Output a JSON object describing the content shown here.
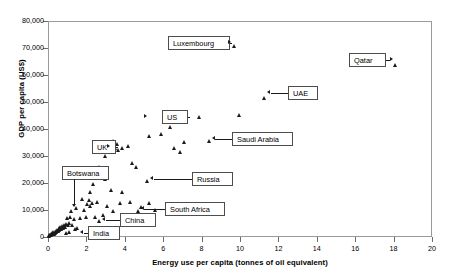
{
  "chart_data": {
    "type": "scatter",
    "title": "",
    "xlabel": "Energy use per capita (tonnes of oil equivalent)",
    "ylabel": "GDP per capita (US$)",
    "xlim": [
      0,
      20
    ],
    "ylim": [
      0,
      80000
    ],
    "grid": false,
    "legend": "none",
    "xticks": [
      "0",
      "2",
      "4",
      "6",
      "8",
      "10",
      "12",
      "14",
      "16",
      "18",
      "20"
    ],
    "xtick_values": [
      0,
      2,
      4,
      6,
      8,
      10,
      12,
      14,
      16,
      18,
      20
    ],
    "yticks": [
      "0",
      "10,000",
      "20,000",
      "30,000",
      "40,000",
      "50,000",
      "60,000",
      "70,000",
      "80,000"
    ],
    "ytick_values": [
      0,
      10000,
      20000,
      30000,
      40000,
      50000,
      60000,
      70000,
      80000
    ],
    "marker": "triangle",
    "marker_color": "#1a1a1a",
    "points": [
      {
        "x": 9.7,
        "y": 70500,
        "label": "Luxembourg"
      },
      {
        "x": 18.1,
        "y": 63500,
        "label": "Qatar"
      },
      {
        "x": 11.3,
        "y": 51500,
        "label": "UAE"
      },
      {
        "x": 10.0,
        "y": 45000,
        "label": ""
      },
      {
        "x": 7.9,
        "y": 44500,
        "label": ""
      },
      {
        "x": 6.4,
        "y": 40500,
        "label": ""
      },
      {
        "x": 8.4,
        "y": 35500,
        "label": "Saudi Arabia"
      },
      {
        "x": 5.9,
        "y": 38000,
        "label": ""
      },
      {
        "x": 7.1,
        "y": 35000,
        "label": ""
      },
      {
        "x": 5.3,
        "y": 37500,
        "label": "US"
      },
      {
        "x": 4.2,
        "y": 33500,
        "label": ""
      },
      {
        "x": 3.9,
        "y": 33000,
        "label": ""
      },
      {
        "x": 3.6,
        "y": 34500,
        "label": ""
      },
      {
        "x": 3.5,
        "y": 33000,
        "label": ""
      },
      {
        "x": 3.7,
        "y": 32000,
        "label": ""
      },
      {
        "x": 3.4,
        "y": 35500,
        "label": "UK"
      },
      {
        "x": 3.3,
        "y": 34000,
        "label": ""
      },
      {
        "x": 3.2,
        "y": 33000,
        "label": ""
      },
      {
        "x": 3.0,
        "y": 30000,
        "label": ""
      },
      {
        "x": 2.7,
        "y": 26000,
        "label": ""
      },
      {
        "x": 2.6,
        "y": 24000,
        "label": ""
      },
      {
        "x": 4.4,
        "y": 27500,
        "label": ""
      },
      {
        "x": 4.6,
        "y": 26000,
        "label": ""
      },
      {
        "x": 5.2,
        "y": 20500,
        "label": "Russia"
      },
      {
        "x": 3.0,
        "y": 21500,
        "label": ""
      },
      {
        "x": 2.4,
        "y": 19500,
        "label": ""
      },
      {
        "x": 2.2,
        "y": 16500,
        "label": ""
      },
      {
        "x": 3.3,
        "y": 17500,
        "label": ""
      },
      {
        "x": 3.9,
        "y": 16500,
        "label": ""
      },
      {
        "x": 4.3,
        "y": 13000,
        "label": ""
      },
      {
        "x": 3.8,
        "y": 12500,
        "label": ""
      },
      {
        "x": 3.1,
        "y": 11500,
        "label": ""
      },
      {
        "x": 2.6,
        "y": 13000,
        "label": ""
      },
      {
        "x": 2.3,
        "y": 12500,
        "label": ""
      },
      {
        "x": 2.2,
        "y": 11500,
        "label": ""
      },
      {
        "x": 1.8,
        "y": 14000,
        "label": ""
      },
      {
        "x": 1.5,
        "y": 10500,
        "label": ""
      },
      {
        "x": 5.3,
        "y": 12500,
        "label": ""
      },
      {
        "x": 4.9,
        "y": 11000,
        "label": ""
      },
      {
        "x": 5.6,
        "y": 10000,
        "label": ""
      },
      {
        "x": 4.7,
        "y": 9500,
        "label": "South Africa"
      },
      {
        "x": 3.4,
        "y": 9500,
        "label": ""
      },
      {
        "x": 2.9,
        "y": 8000,
        "label": ""
      },
      {
        "x": 2.5,
        "y": 7500,
        "label": ""
      },
      {
        "x": 2.0,
        "y": 7500,
        "label": ""
      },
      {
        "x": 1.7,
        "y": 7000,
        "label": ""
      },
      {
        "x": 1.4,
        "y": 6500,
        "label": ""
      },
      {
        "x": 1.2,
        "y": 7500,
        "label": ""
      },
      {
        "x": 1.0,
        "y": 7000,
        "label": ""
      },
      {
        "x": 2.7,
        "y": 6000,
        "label": "China"
      },
      {
        "x": 1.3,
        "y": 4500,
        "label": ""
      },
      {
        "x": 1.15,
        "y": 5200,
        "label": ""
      },
      {
        "x": 1.05,
        "y": 4200,
        "label": ""
      },
      {
        "x": 0.95,
        "y": 4800,
        "label": ""
      },
      {
        "x": 0.9,
        "y": 3800,
        "label": ""
      },
      {
        "x": 0.85,
        "y": 4400,
        "label": ""
      },
      {
        "x": 0.8,
        "y": 3400,
        "label": ""
      },
      {
        "x": 0.78,
        "y": 4000,
        "label": ""
      },
      {
        "x": 0.72,
        "y": 3000,
        "label": ""
      },
      {
        "x": 0.68,
        "y": 3600,
        "label": ""
      },
      {
        "x": 0.62,
        "y": 2600,
        "label": ""
      },
      {
        "x": 0.58,
        "y": 3100,
        "label": ""
      },
      {
        "x": 0.55,
        "y": 2200,
        "label": ""
      },
      {
        "x": 0.5,
        "y": 2700,
        "label": ""
      },
      {
        "x": 0.47,
        "y": 1900,
        "label": ""
      },
      {
        "x": 0.44,
        "y": 2300,
        "label": ""
      },
      {
        "x": 0.4,
        "y": 1500,
        "label": ""
      },
      {
        "x": 0.37,
        "y": 1900,
        "label": ""
      },
      {
        "x": 0.33,
        "y": 1200,
        "label": ""
      },
      {
        "x": 0.3,
        "y": 1600,
        "label": ""
      },
      {
        "x": 0.27,
        "y": 900,
        "label": ""
      },
      {
        "x": 0.24,
        "y": 1300,
        "label": ""
      },
      {
        "x": 0.2,
        "y": 700,
        "label": ""
      },
      {
        "x": 0.17,
        "y": 1000,
        "label": ""
      },
      {
        "x": 0.14,
        "y": 500,
        "label": ""
      },
      {
        "x": 0.11,
        "y": 800,
        "label": ""
      },
      {
        "x": 0.09,
        "y": 400,
        "label": ""
      },
      {
        "x": 0.07,
        "y": 600,
        "label": ""
      },
      {
        "x": 1.55,
        "y": 3200,
        "label": "India"
      },
      {
        "x": 1.45,
        "y": 2800,
        "label": ""
      },
      {
        "x": 1.1,
        "y": 1800,
        "label": ""
      },
      {
        "x": 0.95,
        "y": 1400,
        "label": ""
      },
      {
        "x": 1.25,
        "y": 9500,
        "label": "Botswana"
      },
      {
        "x": 1.9,
        "y": 10000,
        "label": ""
      },
      {
        "x": 2.05,
        "y": 12000,
        "label": ""
      },
      {
        "x": 2.15,
        "y": 13500,
        "label": ""
      },
      {
        "x": 6.6,
        "y": 33000,
        "label": ""
      },
      {
        "x": 6.9,
        "y": 31500,
        "label": ""
      }
    ],
    "annotations": [
      {
        "name": "Luxembourg",
        "text": "Luxembourg",
        "arrow": "right"
      },
      {
        "name": "Qatar",
        "text": "Qatar",
        "arrow": "right"
      },
      {
        "name": "UAE",
        "text": "UAE",
        "arrow": "left"
      },
      {
        "name": "US",
        "text": "US",
        "arrow": "right"
      },
      {
        "name": "Saudi Arabia",
        "text": "Saudi Arabia",
        "arrow": "left"
      },
      {
        "name": "UK",
        "text": "UK",
        "arrow": "right"
      },
      {
        "name": "Russia",
        "text": "Russia",
        "arrow": "left"
      },
      {
        "name": "Botswana",
        "text": "Botswana",
        "arrow": "down"
      },
      {
        "name": "South Africa",
        "text": "South Africa",
        "arrow": "left"
      },
      {
        "name": "China",
        "text": "China",
        "arrow": "left"
      },
      {
        "name": "India",
        "text": "India",
        "arrow": "left"
      }
    ]
  }
}
